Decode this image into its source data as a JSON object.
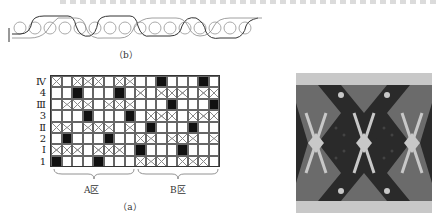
{
  "figure": {
    "caption_b": "（b）",
    "caption_a": "（a）",
    "weave_left_marks": [
      "1",
      "1"
    ],
    "row_labels": [
      "Ⅳ",
      "4",
      "Ⅲ",
      "3",
      "Ⅱ",
      "2",
      "Ⅰ",
      "1"
    ],
    "zone_labels": [
      "A区",
      "B区"
    ],
    "grid": {
      "columns": 16,
      "legend": {
        "B": "black filled cell",
        "X": "crossed cell",
        "_": "empty cell"
      },
      "rows": [
        "X_XXX_XX__B___B_",
        "__B___B_X_XXX_XX",
        "_XXX_XXX___B___B",
        "___B___B_XXX_XXX",
        "XX_XXX_X_B___B__",
        "_B___B__XX_XXX_X",
        "XXX_XXX_B___B___",
        "B___B___XXX_XXX_"
      ]
    },
    "colors": {
      "filled": "#111111",
      "cross": "#888888",
      "gridline": "#666666",
      "fabric_dark": "#2a2a2a",
      "fabric_mid": "#6b6b6b",
      "fabric_light": "#c8c8c8"
    }
  }
}
